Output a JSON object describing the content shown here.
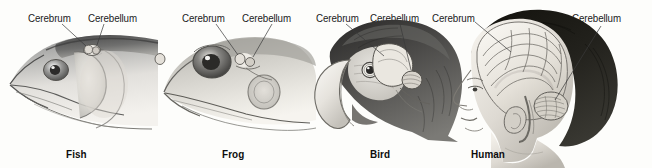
{
  "figure": {
    "background_color": "#fdfdfb",
    "label_color": "#1b1b1b",
    "caption_color": "#0d0d0d",
    "leader_line_color": "#3a3a3a"
  },
  "panels": [
    {
      "id": "fish",
      "caption": "Fish",
      "subject_icon": "fish-head-illustration",
      "labels": [
        {
          "text": "Cerebrum",
          "target": "cerebrum-region"
        },
        {
          "text": "Cerebellum",
          "target": "cerebellum-region"
        }
      ]
    },
    {
      "id": "frog",
      "caption": "Frog",
      "subject_icon": "frog-head-illustration",
      "labels": [
        {
          "text": "Cerebrum",
          "target": "cerebrum-region"
        },
        {
          "text": "Cerebellum",
          "target": "cerebellum-region"
        }
      ]
    },
    {
      "id": "bird",
      "caption": "Bird",
      "subject_icon": "bird-head-illustration",
      "labels": [
        {
          "text": "Cerebrum",
          "target": "cerebrum-region"
        },
        {
          "text": "Cerebellum",
          "target": "cerebellum-region"
        }
      ]
    },
    {
      "id": "human",
      "caption": "Human",
      "subject_icon": "human-head-illustration",
      "labels": [
        {
          "text": "Cerebrum",
          "target": "cerebrum-region"
        },
        {
          "text": "Cerebellum",
          "target": "cerebellum-region"
        }
      ]
    }
  ]
}
